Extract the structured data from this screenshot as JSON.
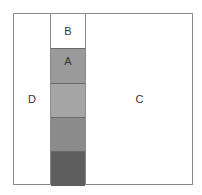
{
  "diagram": {
    "regions": [
      {
        "id": "D",
        "label": "D"
      },
      {
        "id": "C",
        "label": "C"
      }
    ],
    "column": {
      "segments": [
        {
          "id": "B",
          "label": "B",
          "color": "#ffffff"
        },
        {
          "id": "A",
          "label": "A",
          "color": "#9a9a9a"
        },
        {
          "id": "seg3",
          "label": "",
          "color": "#a6a6a6"
        },
        {
          "id": "seg4",
          "label": "",
          "color": "#8b8b8b"
        },
        {
          "id": "seg5",
          "label": "",
          "color": "#5e5e5e"
        }
      ]
    },
    "border_color": "#8a8a8a"
  }
}
